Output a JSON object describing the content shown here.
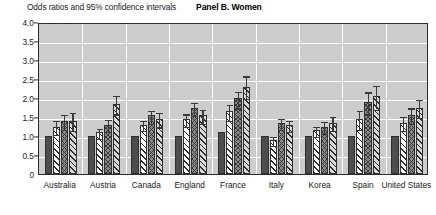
{
  "header": {
    "axis_caption": "Odds ratios and 95% confidence intervals",
    "panel_title": "Panel B. Women"
  },
  "colors": {
    "plot_background": "#cccccc",
    "gridline": "#ffffff",
    "axis": "#2b2b2b",
    "series1": "#4d4d4d",
    "series2": "#ffffff",
    "series3": "#8a8a8a",
    "series4": "#d8d8d8"
  },
  "chart_data": {
    "type": "bar",
    "title": "Panel B. Women",
    "xlabel": "",
    "ylabel": "Odds ratios and 95% confidence intervals",
    "ylim": [
      0,
      4.0
    ],
    "yticks": [
      0,
      0.5,
      1.0,
      1.5,
      2.0,
      2.5,
      3.0,
      3.5,
      4.0
    ],
    "ytick_labels": [
      "0",
      "0.5",
      "1.0",
      "1.5",
      "2.0",
      "2.5",
      "3.0",
      "3.5",
      "4.0"
    ],
    "grid": true,
    "legend": "none",
    "categories": [
      "Australia",
      "Austria",
      "Canada",
      "England",
      "France",
      "Italy",
      "Korea",
      "Spain",
      "United States"
    ],
    "series": [
      {
        "name": "series-1",
        "style": "solid-dark",
        "values": [
          1.0,
          1.0,
          1.0,
          1.0,
          1.1,
          1.0,
          1.0,
          1.0,
          1.0
        ],
        "ci_lower": [
          1.0,
          1.0,
          1.0,
          1.0,
          1.1,
          1.0,
          1.0,
          1.0,
          1.0
        ],
        "ci_upper": [
          1.0,
          1.0,
          1.0,
          1.0,
          1.1,
          1.0,
          1.0,
          1.0,
          1.0
        ]
      },
      {
        "name": "series-2",
        "style": "white-hatch",
        "values": [
          1.25,
          1.1,
          1.3,
          1.45,
          1.65,
          0.9,
          1.15,
          1.45,
          1.35
        ],
        "ci_lower": [
          1.08,
          0.98,
          1.18,
          1.3,
          1.45,
          0.8,
          1.02,
          1.22,
          1.18
        ],
        "ci_upper": [
          1.45,
          1.25,
          1.45,
          1.62,
          1.88,
          1.02,
          1.3,
          1.72,
          1.55
        ]
      },
      {
        "name": "series-3",
        "style": "gray-crosshatch",
        "values": [
          1.4,
          1.3,
          1.55,
          1.75,
          2.0,
          1.35,
          1.25,
          1.9,
          1.55
        ],
        "ci_lower": [
          1.22,
          1.15,
          1.38,
          1.58,
          1.78,
          1.22,
          1.1,
          1.62,
          1.38
        ],
        "ci_upper": [
          1.6,
          1.48,
          1.72,
          1.92,
          2.22,
          1.5,
          1.42,
          2.2,
          1.78
        ]
      },
      {
        "name": "series-4",
        "style": "light-hatch",
        "values": [
          1.4,
          1.85,
          1.45,
          1.55,
          2.3,
          1.3,
          1.35,
          2.05,
          1.75
        ],
        "ci_lower": [
          1.18,
          1.62,
          1.28,
          1.38,
          2.02,
          1.15,
          1.18,
          1.75,
          1.52
        ],
        "ci_upper": [
          1.65,
          2.1,
          1.65,
          1.75,
          2.62,
          1.45,
          1.55,
          2.38,
          2.0
        ]
      }
    ]
  }
}
